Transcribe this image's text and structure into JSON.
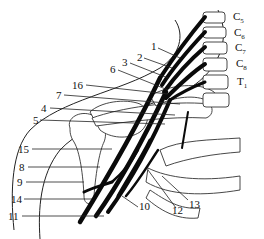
{
  "figure": {
    "spinal_labels": [
      {
        "letter": "C",
        "sub": "5"
      },
      {
        "letter": "C",
        "sub": "6"
      },
      {
        "letter": "C",
        "sub": "7"
      },
      {
        "letter": "C",
        "sub": "8"
      },
      {
        "letter": "T",
        "sub": "1"
      }
    ],
    "number_labels": [
      "1",
      "2",
      "3",
      "6",
      "16",
      "7",
      "4",
      "5",
      "15",
      "8",
      "9",
      "14",
      "11",
      "10",
      "12",
      "13"
    ]
  }
}
